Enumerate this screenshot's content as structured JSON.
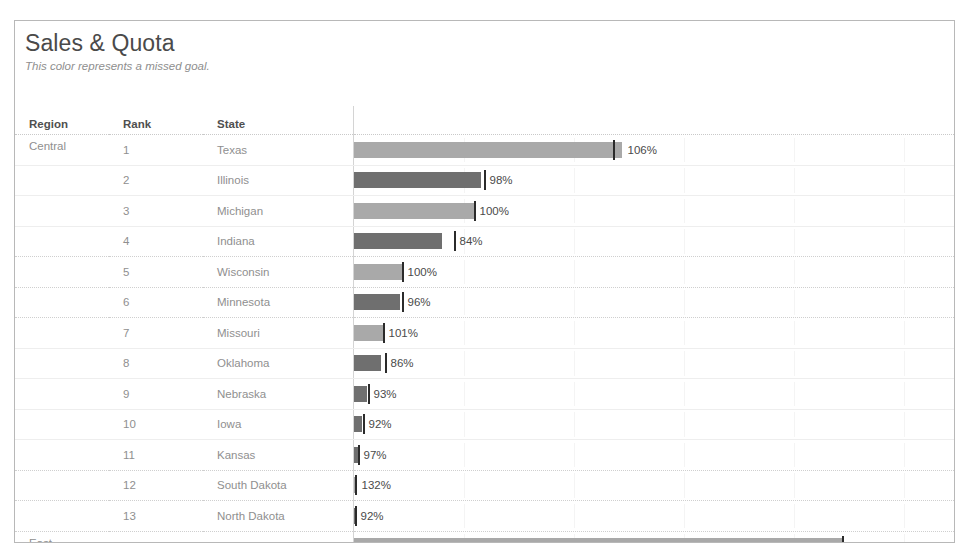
{
  "viz": {
    "title": "Sales & Quota",
    "subtitle": "This color represents a missed goal."
  },
  "table": {
    "headers": {
      "region": "Region",
      "rank": "Rank",
      "state": "State",
      "bar": ""
    }
  },
  "legend": {
    "met_color": "#a9a9a9",
    "missed_color": "#6f6f6f",
    "marker_color": "#2b2b2b"
  },
  "chart_data": {
    "type": "bar",
    "title": "Sales & Quota",
    "subtitle": "This color represents a missed goal.",
    "xlabel": "",
    "ylabel": "",
    "grid": true,
    "legend_position": "subtitle",
    "value_unit": "percent of quota",
    "columns": [
      "Region",
      "Rank",
      "State",
      "Percent of Quota"
    ],
    "rows": [
      {
        "region": "Central",
        "rank": "1",
        "state": "Texas",
        "label": "106%",
        "value": 106,
        "missed": false,
        "bar_px": 268,
        "marker_px": 259
      },
      {
        "region": "",
        "rank": "2",
        "state": "Illinois",
        "label": "98%",
        "value": 98,
        "missed": true,
        "bar_px": 127,
        "marker_px": 130
      },
      {
        "region": "",
        "rank": "3",
        "state": "Michigan",
        "label": "100%",
        "value": 100,
        "missed": false,
        "bar_px": 120,
        "marker_px": 120
      },
      {
        "region": "",
        "rank": "4",
        "state": "Indiana",
        "label": "84%",
        "value": 84,
        "missed": true,
        "bar_px": 88,
        "marker_px": 100
      },
      {
        "region": "",
        "rank": "5",
        "state": "Wisconsin",
        "label": "100%",
        "value": 100,
        "missed": false,
        "bar_px": 48,
        "marker_px": 48
      },
      {
        "region": "",
        "rank": "6",
        "state": "Minnesota",
        "label": "96%",
        "value": 96,
        "missed": true,
        "bar_px": 46,
        "marker_px": 48
      },
      {
        "region": "",
        "rank": "7",
        "state": "Missouri",
        "label": "101%",
        "value": 101,
        "missed": false,
        "bar_px": 29,
        "marker_px": 29
      },
      {
        "region": "",
        "rank": "8",
        "state": "Oklahoma",
        "label": "86%",
        "value": 86,
        "missed": true,
        "bar_px": 27,
        "marker_px": 31
      },
      {
        "region": "",
        "rank": "9",
        "state": "Nebraska",
        "label": "93%",
        "value": 93,
        "missed": true,
        "bar_px": 13,
        "marker_px": 14
      },
      {
        "region": "",
        "rank": "10",
        "state": "Iowa",
        "label": "92%",
        "value": 92,
        "missed": true,
        "bar_px": 8,
        "marker_px": 9
      },
      {
        "region": "",
        "rank": "11",
        "state": "Kansas",
        "label": "97%",
        "value": 97,
        "missed": true,
        "bar_px": 4,
        "marker_px": 4
      },
      {
        "region": "",
        "rank": "12",
        "state": "South Dakota",
        "label": "132%",
        "value": 132,
        "missed": false,
        "bar_px": 2,
        "marker_px": 1
      },
      {
        "region": "",
        "rank": "13",
        "state": "North Dakota",
        "label": "92%",
        "value": 92,
        "missed": true,
        "bar_px": 1,
        "marker_px": 1
      },
      {
        "region": "East",
        "rank": "1",
        "state": "New York",
        "label": "100%",
        "value": 100,
        "missed": false,
        "bar_px": 488,
        "marker_px": 488
      },
      {
        "region": "",
        "rank": "2",
        "state": "Pennsylvania",
        "label": "92%",
        "value": 92,
        "missed": true,
        "bar_px": 201,
        "marker_px": 207
      },
      {
        "region": "",
        "rank": "3",
        "state": "Ohio",
        "label": "94%",
        "value": 94,
        "missed": true,
        "bar_px": 126,
        "marker_px": 131
      },
      {
        "region": "",
        "rank": "4",
        "state": "New Jersey",
        "label": "115%",
        "value": 115,
        "missed": false,
        "bar_px": 48,
        "marker_px": 50
      }
    ],
    "gridlines_px": [
      110,
      220,
      330,
      440,
      550
    ],
    "row_groups": [
      {
        "region": "Central",
        "count": 13
      },
      {
        "region": "East",
        "count": 4,
        "truncated": true
      }
    ]
  }
}
